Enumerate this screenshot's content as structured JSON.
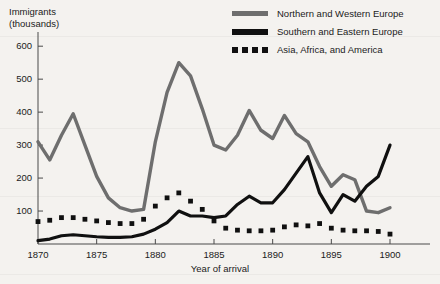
{
  "chart_data": {
    "type": "line",
    "title": "",
    "xlabel": "Year of arrival",
    "ylabel": "Immigrants\n(thousands)",
    "ylabel_line1": "Immigrants",
    "ylabel_line2": "(thousands)",
    "xlim": [
      1870,
      1900
    ],
    "ylim": [
      0,
      640
    ],
    "yticks": [
      100,
      200,
      300,
      400,
      500,
      600
    ],
    "ytick_labels": [
      "100",
      "200",
      "300",
      "400",
      "500",
      "600"
    ],
    "xticks": [
      1870,
      1875,
      1880,
      1885,
      1890,
      1895,
      1900
    ],
    "xtick_labels": [
      "1870",
      "1875",
      "1880",
      "1885",
      "1890",
      "1895",
      "1900"
    ],
    "grid": false,
    "legend_position": "top-right",
    "x": [
      1870,
      1871,
      1872,
      1873,
      1874,
      1875,
      1876,
      1877,
      1878,
      1879,
      1880,
      1881,
      1882,
      1883,
      1884,
      1885,
      1886,
      1887,
      1888,
      1889,
      1890,
      1891,
      1892,
      1893,
      1894,
      1895,
      1896,
      1897,
      1898,
      1899,
      1900
    ],
    "series": [
      {
        "name": "Northern and Western Europe",
        "style": "solid",
        "color": "#6e6e6e",
        "values": [
          310,
          255,
          330,
          395,
          300,
          205,
          140,
          110,
          100,
          105,
          310,
          460,
          550,
          510,
          410,
          300,
          285,
          330,
          405,
          345,
          320,
          390,
          335,
          310,
          235,
          175,
          210,
          195,
          100,
          95,
          110
        ]
      },
      {
        "name": "Southern and Eastern Europe",
        "style": "solid",
        "color": "#101010",
        "values": [
          10,
          15,
          25,
          28,
          25,
          22,
          20,
          20,
          22,
          30,
          45,
          65,
          100,
          85,
          85,
          80,
          85,
          120,
          145,
          125,
          125,
          165,
          215,
          265,
          155,
          95,
          150,
          130,
          175,
          205,
          300
        ]
      },
      {
        "name": "Asia, Africa, and America",
        "style": "dotted",
        "color": "#101010",
        "values": [
          68,
          72,
          80,
          80,
          75,
          70,
          65,
          62,
          62,
          75,
          115,
          140,
          155,
          130,
          105,
          70,
          48,
          42,
          40,
          40,
          42,
          52,
          58,
          55,
          62,
          48,
          42,
          40,
          40,
          38,
          30
        ]
      }
    ]
  },
  "legend": {
    "items": [
      {
        "label": "Northern and Western Europe",
        "swatch": "gray-solid"
      },
      {
        "label": "Southern and Eastern Europe",
        "swatch": "black-solid"
      },
      {
        "label": "Asia, Africa, and America",
        "swatch": "black-dotted"
      }
    ]
  },
  "colors": {
    "background": "#f4f2ef",
    "axis": "#4a4a4a",
    "text": "#1b1b1b",
    "series_gray": "#6e6e6e",
    "series_black": "#101010"
  }
}
